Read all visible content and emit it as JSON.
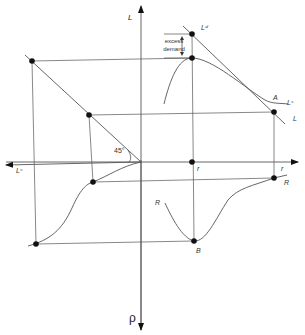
{
  "diagram": {
    "axes": {
      "top": "L",
      "bottom": "ρ",
      "left": "Lˢ",
      "right": "r"
    },
    "labels": {
      "demand_curve_top": "Lᵈ",
      "supply_curve": "Lˢ",
      "point_A": "A",
      "L_line": "L",
      "r_origin": "r",
      "r_right": "r",
      "R_right": "R",
      "R_left": "R",
      "point_B": "B",
      "angle": "45°"
    },
    "annotation": {
      "excess_demand_line1": "excess",
      "excess_demand_line2": "demand"
    },
    "colors": {
      "line": "#555555",
      "point": "#111111",
      "text": "#333333"
    }
  }
}
